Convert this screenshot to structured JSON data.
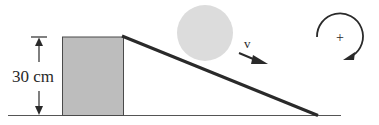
{
  "diagram": {
    "height_label": "30 cm",
    "velocity_label": "v",
    "rotation_sign_label": "+",
    "colors": {
      "block_fill": "#bdbdbd",
      "ball_fill": "#dcdcdc",
      "line": "#2a2a2a",
      "ground": "#555555"
    },
    "elements": {
      "ground": "ground-line",
      "block": "support-block",
      "ramp": "inclined-ramp",
      "ball": "rolling-ball",
      "velocity": "velocity-arrow",
      "rotation": "positive-rotation-direction (clockwise)"
    }
  }
}
